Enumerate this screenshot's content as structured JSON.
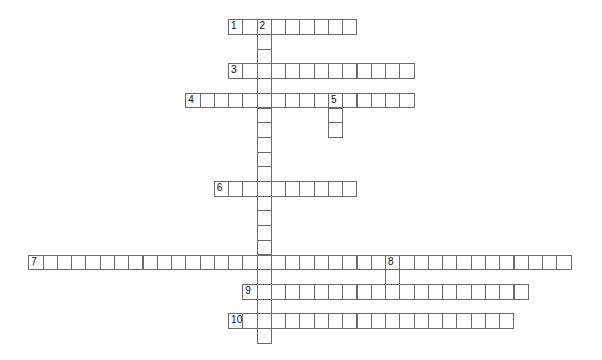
{
  "puzzle": {
    "grid": {
      "x0": 28.3,
      "y0": 19.3,
      "cell_w": 14.27,
      "cell_h": 14.7
    },
    "colors": {
      "border": "#6a6a6a",
      "background": "#ffffff",
      "number": "#111111"
    },
    "words": [
      {
        "number": "1",
        "direction": "across",
        "row": 0,
        "col": 14,
        "length": 9
      },
      {
        "number": "2",
        "direction": "down",
        "row": 0,
        "col": 16,
        "length": 22
      },
      {
        "number": "3",
        "direction": "across",
        "row": 3,
        "col": 14,
        "length": 13
      },
      {
        "number": "4",
        "direction": "across",
        "row": 5,
        "col": 11,
        "length": 16
      },
      {
        "number": "5",
        "direction": "down",
        "row": 5,
        "col": 21,
        "length": 3
      },
      {
        "number": "6",
        "direction": "across",
        "row": 11,
        "col": 13,
        "length": 10
      },
      {
        "number": "7",
        "direction": "across",
        "row": 16,
        "col": 0,
        "length": 38
      },
      {
        "number": "8",
        "direction": "down",
        "row": 16,
        "col": 25,
        "length": 3
      },
      {
        "number": "9",
        "direction": "across",
        "row": 18,
        "col": 15,
        "length": 20
      },
      {
        "number": "10",
        "direction": "across",
        "row": 20,
        "col": 14,
        "length": 20
      }
    ]
  }
}
